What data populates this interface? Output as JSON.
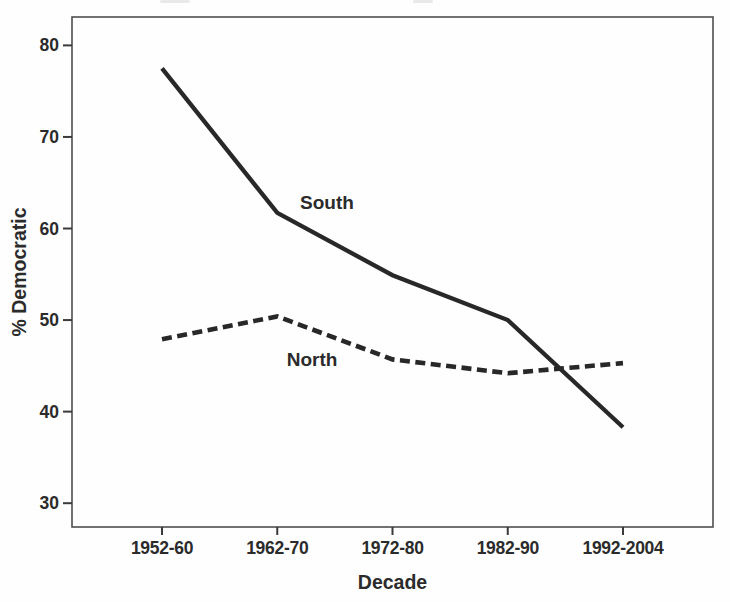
{
  "chart_data": {
    "type": "line",
    "title": "",
    "xlabel": "Decade",
    "ylabel": "% Democratic",
    "categories": [
      "1952-60",
      "1962-70",
      "1972-80",
      "1982-90",
      "1992-2004"
    ],
    "series": [
      {
        "name": "South",
        "style": "solid",
        "color": "#282828",
        "stroke_width": 4.3,
        "values": [
          77.5,
          61.7,
          54.9,
          50.0,
          38.3
        ]
      },
      {
        "name": "North",
        "style": "dashed",
        "color": "#282828",
        "stroke_width": 4.6,
        "dash_pattern": "10 5.5",
        "values": [
          47.9,
          50.4,
          45.7,
          44.2,
          45.3
        ]
      }
    ],
    "y_ticks": [
      30,
      40,
      50,
      60,
      70,
      80
    ],
    "ylim": [
      27.4,
      83.1
    ],
    "grid": false,
    "legend": "inline-labels",
    "annotations": [
      {
        "text": "South",
        "x_px": 327,
        "y_px": 202
      },
      {
        "text": "North",
        "x_px": 312,
        "y_px": 359
      }
    ],
    "frame_color": "#4f4f4f",
    "tick_color": "#3a3a3a"
  }
}
